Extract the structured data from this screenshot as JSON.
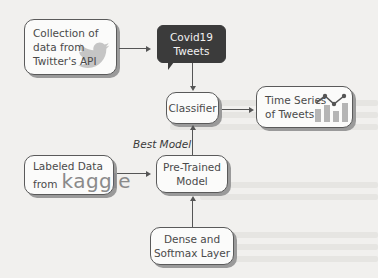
{
  "diagram": {
    "nodes": {
      "twitter_api": {
        "line1": "Collection of",
        "line2": "data from",
        "line3": "Twitter's API",
        "icon": "twitter-bird-icon"
      },
      "covid_tweets": {
        "line1": "Covid19",
        "line2": "Tweets"
      },
      "classifier": {
        "label": "Classifier"
      },
      "time_series": {
        "line1": "Time Series",
        "line2": "of Tweets",
        "icon": "bar-line-chart-icon"
      },
      "labeled_data": {
        "line1": "Labeled Data",
        "line2_prefix": "from",
        "brand": "kaggle"
      },
      "pretrained": {
        "line1": "Pre-Trained",
        "line2": "Model"
      },
      "dense": {
        "line1": "Dense and",
        "line2": "Softmax Layer"
      }
    },
    "edge_labels": {
      "best_model": "Best Model"
    },
    "colors": {
      "dark_box": "#3b3b3b",
      "border": "#5a5a5a",
      "shadow": "#9a9a9a",
      "icon_gray": "#b5b5b5"
    }
  }
}
